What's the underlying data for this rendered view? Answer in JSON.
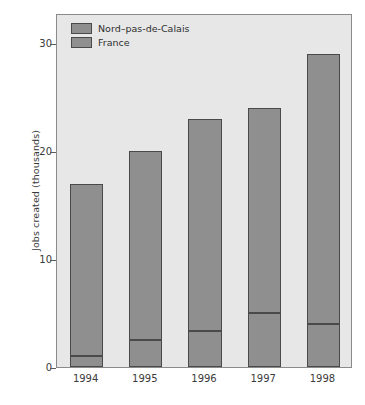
{
  "chart_data": {
    "type": "bar",
    "subtype": "stacked-bar",
    "title": "",
    "xlabel": "",
    "ylabel": "Jobs created (thousands)",
    "categories": [
      "1994",
      "1995",
      "1996",
      "1997",
      "1998"
    ],
    "series": [
      {
        "name": "France",
        "note": "lower segment of each stacked bar",
        "values": [
          1.0,
          2.5,
          3.3,
          5.0,
          4.0
        ]
      },
      {
        "name": "Nord–pas-de-Calais",
        "note": "upper segment of each stacked bar; totals shown are cumulative bar tops",
        "values": [
          16.0,
          17.5,
          19.7,
          19.0,
          25.0
        ]
      }
    ],
    "totals": [
      17.0,
      20.0,
      23.0,
      24.0,
      29.0
    ],
    "ylim": [
      0,
      32.8
    ],
    "yticks": [
      0,
      10,
      20,
      30
    ],
    "ytick_labels": [
      "0",
      "10",
      "20",
      "30"
    ],
    "grid": false,
    "legend_position": "top-left-inside",
    "colors": {
      "bar_fill": "#8f8f8f",
      "bar_edge": "#4a4a4a",
      "plot_background": "#e7e7e7",
      "figure_background": "#ffffff",
      "axis": "#5a5a5a",
      "text": "#333333"
    }
  },
  "legend": {
    "items": [
      {
        "label": "Nord–pas-de-Calais"
      },
      {
        "label": "France"
      }
    ]
  },
  "axes": {
    "y_title": "Jobs created (thousands)",
    "y_ticks": [
      {
        "label": "30",
        "value": 30
      },
      {
        "label": "20",
        "value": 20
      },
      {
        "label": "10",
        "value": 10
      },
      {
        "label": "0",
        "value": 0
      }
    ],
    "x_ticks": [
      {
        "label": "1994"
      },
      {
        "label": "1995"
      },
      {
        "label": "1996"
      },
      {
        "label": "1997"
      },
      {
        "label": "1998"
      }
    ]
  }
}
